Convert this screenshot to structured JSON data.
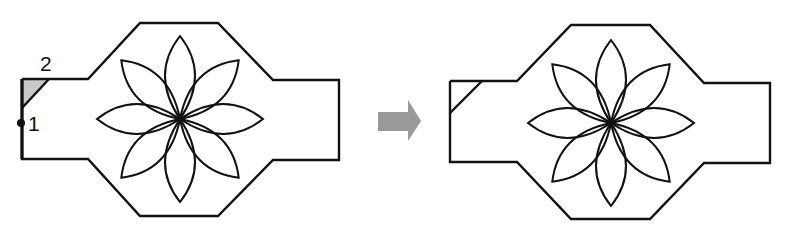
{
  "diagram": {
    "type": "before-after procedure illustration",
    "left_figure": {
      "description": "Octagonal plate with side arms and eight-petal flower; corner chamfer drawn from point 1 to point 2",
      "labels": {
        "point1": "1",
        "point2": "2"
      }
    },
    "arrow": {
      "direction": "right",
      "color": "#999999"
    },
    "right_figure": {
      "description": "Same plate with the chamfer applied at the upper-left corner"
    },
    "colors": {
      "stroke": "#111111",
      "arrow": "#999999",
      "chamfer_fill": "#c8c8c8",
      "background": "#ffffff"
    }
  }
}
